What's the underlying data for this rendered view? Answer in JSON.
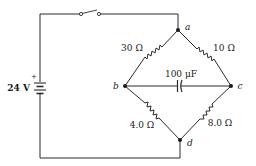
{
  "diagram": {
    "type": "circuit",
    "source": {
      "label": "24 V",
      "polarity_mark": "+",
      "voltage_volts": 24
    },
    "switch": {
      "state": "open"
    },
    "nodes": {
      "a": "a",
      "b": "b",
      "c": "c",
      "d": "d"
    },
    "components": [
      {
        "id": "R_ab",
        "kind": "resistor",
        "label": "30 Ω",
        "from": "a",
        "to": "b",
        "value_ohms": 30
      },
      {
        "id": "R_ac",
        "kind": "resistor",
        "label": "10 Ω",
        "from": "a",
        "to": "c",
        "value_ohms": 10
      },
      {
        "id": "R_bd",
        "kind": "resistor",
        "label": "4.0 Ω",
        "from": "b",
        "to": "d",
        "value_ohms": 4.0
      },
      {
        "id": "R_cd",
        "kind": "resistor",
        "label": "8.0 Ω",
        "from": "c",
        "to": "d",
        "value_ohms": 8.0
      },
      {
        "id": "C_bc",
        "kind": "capacitor",
        "label": "100 μF",
        "from": "b",
        "to": "c",
        "value_farads": 0.0001
      }
    ],
    "colors": {
      "ink": "#1a1a1a",
      "background": "#ffffff"
    }
  }
}
